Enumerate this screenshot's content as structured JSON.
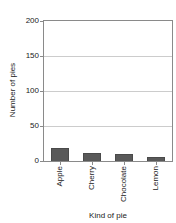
{
  "chart_data": {
    "type": "bar",
    "title": "",
    "categories": [
      "Apple",
      "Cherry",
      "Chocolate",
      "Lemon"
    ],
    "values": [
      18,
      11,
      10,
      6
    ],
    "xlabel": "Kind of pie",
    "ylabel": "Number of pies",
    "ylim": [
      0,
      200
    ],
    "yticks": [
      0,
      50,
      100,
      150,
      200
    ],
    "grid": true,
    "legend": "none",
    "bar_color": "#595959",
    "grid_color": "#cccccc",
    "axis_color": "#8a8a8a",
    "text_color": "#222222",
    "background": "#ffffff"
  }
}
